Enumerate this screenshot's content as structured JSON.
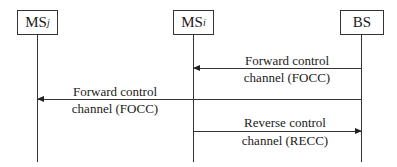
{
  "diagram": {
    "type": "sequence",
    "entities": [
      {
        "id": "msj",
        "label": "MS",
        "subscript": "j"
      },
      {
        "id": "msi",
        "label": "MS",
        "subscript": "i"
      },
      {
        "id": "bs",
        "label": "BS",
        "subscript": ""
      }
    ],
    "messages": [
      {
        "from": "BS",
        "to": "MS_i",
        "line1": "Forward control",
        "line2": "channel (FOCC)"
      },
      {
        "from": "BS",
        "to": "MS_j",
        "line1": "Forward control",
        "line2": "channel (FOCC)"
      },
      {
        "from": "MS_i",
        "to": "BS",
        "line1": "Reverse control",
        "line2": "channel (RECC)"
      }
    ]
  }
}
